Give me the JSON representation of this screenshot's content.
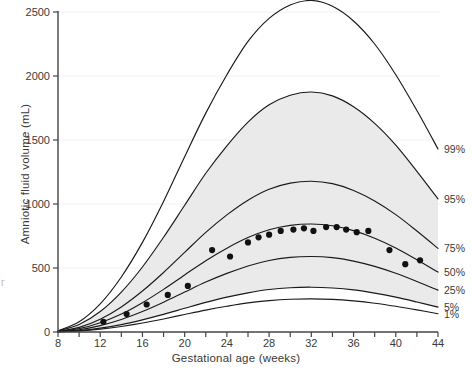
{
  "chart_data": {
    "type": "line",
    "title": "",
    "xlabel": "Gestational age (weeks)",
    "ylabel": "Amniotic fluid volume (mL)",
    "xlim": [
      8,
      44
    ],
    "ylim": [
      0,
      2500
    ],
    "xticks": [
      8,
      10,
      12,
      14,
      16,
      18,
      20,
      22,
      24,
      26,
      28,
      30,
      32,
      34,
      36,
      38,
      40,
      42,
      44
    ],
    "xtick_labels": [
      "8",
      "12",
      "16",
      "20",
      "24",
      "28",
      "32",
      "36",
      "40",
      "44"
    ],
    "xtick_labeled_values": [
      8,
      12,
      16,
      20,
      24,
      28,
      32,
      36,
      40,
      44
    ],
    "yticks": [
      0,
      500,
      1000,
      1500,
      2000,
      2500
    ],
    "ytick_labels": [
      "0",
      "500",
      "1000",
      "1500",
      "2000",
      "2500"
    ],
    "grid": "horizontal-light",
    "legend_position": "right-inline",
    "shaded_band": {
      "label": "5th-95th percentile band",
      "color": "#e6e6e6",
      "upper_series": "95%",
      "lower_series": "5%"
    },
    "x": [
      8,
      10,
      12,
      14,
      16,
      18,
      20,
      22,
      24,
      26,
      28,
      30,
      32,
      34,
      36,
      38,
      40,
      42,
      44
    ],
    "series": [
      {
        "name": "99%",
        "label": "99%",
        "color": "#1a1a1a",
        "values": [
          10,
          80,
          220,
          430,
          700,
          1020,
          1370,
          1710,
          2010,
          2270,
          2450,
          2555,
          2590,
          2545,
          2430,
          2250,
          2010,
          1730,
          1430
        ]
      },
      {
        "name": "95%",
        "label": "95%",
        "color": "#1a1a1a",
        "values": [
          8,
          58,
          160,
          312,
          508,
          740,
          990,
          1240,
          1455,
          1640,
          1775,
          1850,
          1875,
          1845,
          1760,
          1630,
          1460,
          1255,
          1040
        ]
      },
      {
        "name": "75%",
        "label": "75%",
        "color": "#1a1a1a",
        "values": [
          5,
          36,
          100,
          196,
          320,
          465,
          622,
          778,
          915,
          1030,
          1115,
          1163,
          1178,
          1159,
          1106,
          1024,
          917,
          789,
          653
        ]
      },
      {
        "name": "50%",
        "label": "50%",
        "color": "#1a1a1a",
        "values": [
          4,
          26,
          72,
          140,
          229,
          333,
          446,
          557,
          655,
          738,
          799,
          833,
          844,
          830,
          792,
          733,
          657,
          565,
          468
        ]
      },
      {
        "name": "25%",
        "label": "25%",
        "color": "#1a1a1a",
        "values": [
          3,
          18,
          50,
          98,
          160,
          233,
          312,
          390,
          458,
          516,
          559,
          583,
          590,
          581,
          554,
          513,
          459,
          395,
          327
        ]
      },
      {
        "name": "5%",
        "label": "5%",
        "color": "#1a1a1a",
        "values": [
          2,
          11,
          30,
          58,
          95,
          138,
          185,
          231,
          272,
          306,
          332,
          346,
          350,
          344,
          329,
          304,
          272,
          234,
          194
        ]
      },
      {
        "name": "1%",
        "label": "1%",
        "color": "#1a1a1a",
        "values": [
          1,
          8,
          22,
          43,
          70,
          102,
          137,
          171,
          201,
          227,
          245,
          256,
          259,
          255,
          243,
          225,
          201,
          173,
          143
        ]
      }
    ],
    "scatter": {
      "name": "observed-measurements",
      "label": "Observed amniotic fluid volume",
      "marker": "filled-circle",
      "color": "#111111",
      "points": [
        {
          "x": 12.3,
          "y": 80
        },
        {
          "x": 14.5,
          "y": 140
        },
        {
          "x": 16.4,
          "y": 215
        },
        {
          "x": 18.4,
          "y": 290
        },
        {
          "x": 20.3,
          "y": 360
        },
        {
          "x": 22.6,
          "y": 640
        },
        {
          "x": 24.3,
          "y": 590
        },
        {
          "x": 26.0,
          "y": 700
        },
        {
          "x": 27.0,
          "y": 740
        },
        {
          "x": 28.0,
          "y": 760
        },
        {
          "x": 29.1,
          "y": 790
        },
        {
          "x": 30.3,
          "y": 800
        },
        {
          "x": 31.3,
          "y": 810
        },
        {
          "x": 32.2,
          "y": 790
        },
        {
          "x": 33.4,
          "y": 820
        },
        {
          "x": 34.4,
          "y": 820
        },
        {
          "x": 35.3,
          "y": 800
        },
        {
          "x": 36.3,
          "y": 780
        },
        {
          "x": 37.4,
          "y": 790
        },
        {
          "x": 39.4,
          "y": 640
        },
        {
          "x": 40.9,
          "y": 530
        },
        {
          "x": 42.3,
          "y": 560
        }
      ]
    }
  },
  "edge_text": "г"
}
